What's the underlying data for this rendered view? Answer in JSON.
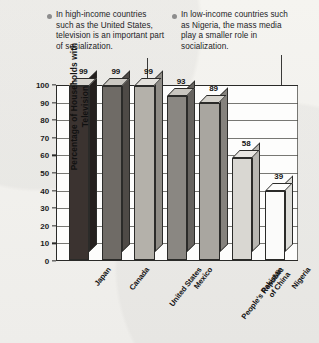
{
  "callouts": [
    {
      "id": "high-income",
      "bullet": "bullet-icon",
      "text": "In high-income countries such as the United States, television is an important part of socialization."
    },
    {
      "id": "low-income",
      "bullet": "bullet-icon",
      "text": "In low-income countries such as Nigeria, the mass media play a smaller role in socialization."
    }
  ],
  "chart_data": {
    "type": "bar",
    "title": "",
    "xlabel": "",
    "ylabel": "Percentage of Households with Television",
    "categories": [
      "Japan",
      "Canada",
      "United States",
      "Mexico",
      "People's Republic of China",
      "Pakistan",
      "Nigeria"
    ],
    "values": [
      99,
      99,
      99,
      93,
      89,
      58,
      39
    ],
    "ylim": [
      0,
      100
    ],
    "yticks": [
      0,
      10,
      20,
      30,
      40,
      50,
      60,
      70,
      80,
      90,
      100
    ],
    "grid": true,
    "legend": "none",
    "bar_colors": [
      "#3b3330",
      "#6f6b66",
      "#b4b1aa",
      "#8a8782",
      "#a9a6a0",
      "#d9d7d2",
      "#fbfbfa"
    ],
    "bar_top_colors": [
      "#d8d5cf",
      "#cbc8c2",
      "#e3e1dc",
      "#c9c6c0",
      "#d6d4ce",
      "#e8e6e2",
      "#fdfdfc"
    ],
    "bar_side_colors": [
      "#241f1d",
      "#4e4a46",
      "#8e8b85",
      "#66635f",
      "#85827d",
      "#b8b6b1",
      "#ddddd9"
    ]
  }
}
